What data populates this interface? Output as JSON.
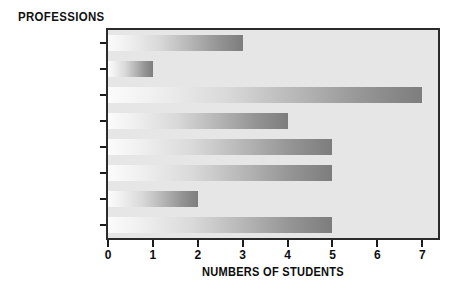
{
  "chart_data": {
    "type": "bar",
    "orientation": "horizontal",
    "title": "PROFESSIONS",
    "xlabel": "NUMBERS OF STUDENTS",
    "ylabel": "",
    "categories": [
      "Basketball player",
      "Chef",
      "Scientist",
      "Carpenter",
      "Writer",
      "Doctor",
      "Actor",
      "Teacher"
    ],
    "values": [
      3,
      1,
      7,
      4,
      5,
      5,
      2,
      5
    ],
    "xlim": [
      0,
      7.35
    ],
    "xticks": [
      0,
      1,
      2,
      3,
      4,
      5,
      6,
      7
    ],
    "xtick_labels": [
      "0",
      "1",
      "2",
      "3",
      "4",
      "5",
      "6",
      "7"
    ],
    "grid": false,
    "legend": false,
    "colors": {
      "plot_background": "#e6e6e6",
      "page_background": "#ffffff",
      "border": "#2b2b2b",
      "text": "#0d0d0d",
      "bar_gradient_start": "#fbfbfb",
      "bar_gradient_end": "#7d7d7d"
    }
  }
}
